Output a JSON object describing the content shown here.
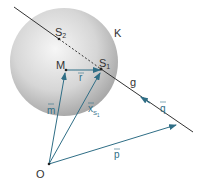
{
  "diagram": {
    "colors": {
      "sphere_light": "#f4f4f4",
      "sphere_dark": "#9a9a9a",
      "line": "#333333",
      "vector": "#2f6e86",
      "text": "#333333"
    },
    "sphere": {
      "label": "K",
      "cx": 64,
      "cy": 62,
      "r": 54
    },
    "line_g": {
      "label": "g",
      "from": [
        14,
        7
      ],
      "to": [
        193,
        132
      ]
    },
    "points": {
      "S2": {
        "label": "S",
        "sub": "2",
        "x": 59,
        "y": 40
      },
      "S1": {
        "label": "S",
        "sub": "1",
        "x": 101,
        "y": 70
      },
      "M": {
        "label": "M",
        "x": 66,
        "y": 70
      },
      "O": {
        "label": "O",
        "x": 49,
        "y": 164
      }
    },
    "vectors": {
      "r": {
        "label": "r",
        "from": "M",
        "to": "S1"
      },
      "m": {
        "label": "m",
        "from": "O",
        "to": "M"
      },
      "xS1": {
        "label": "x",
        "sub": "S1",
        "from": "O",
        "to": "S1"
      },
      "p": {
        "label": "p",
        "from": "O",
        "to": [
          177,
          125
        ]
      },
      "q": {
        "label": "q",
        "direction_on_g": "toward S1"
      }
    }
  }
}
